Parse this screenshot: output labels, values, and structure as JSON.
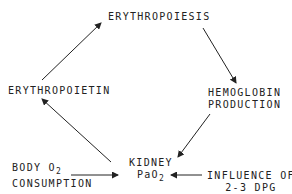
{
  "nodes": {
    "erythropoiesis": "ERYTHROPOIESIS",
    "erythropoietin": "ERYTHROPOIETIN",
    "hemoglobin_line1": "HEMOGLOBIN",
    "hemoglobin_line2": "PRODUCTION",
    "kidney_line1": "KIDNEY",
    "kidney_line2_main": "PaO",
    "kidney_line2_sub": "2",
    "body_line1_main": "BODY O",
    "body_line1_sub": "2",
    "body_line2": "CONSUMPTION",
    "influence_line1": "INFLUENCE OF",
    "influence_line2": "2-3 DPG"
  },
  "edges": [
    {
      "from": "erythropoietin",
      "to": "erythropoiesis"
    },
    {
      "from": "erythropoiesis",
      "to": "hemoglobin_production"
    },
    {
      "from": "hemoglobin_production",
      "to": "kidney_pao2"
    },
    {
      "from": "kidney_pao2",
      "to": "erythropoietin"
    },
    {
      "from": "body_o2_consumption",
      "to": "kidney_pao2"
    },
    {
      "from": "influence_of_2_3_dpg",
      "to": "kidney_pao2"
    }
  ]
}
